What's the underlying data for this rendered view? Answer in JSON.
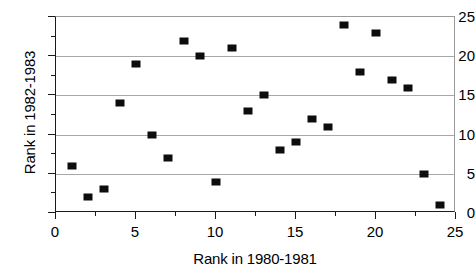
{
  "chart_data": {
    "type": "scatter",
    "title": "",
    "xlabel": "Rank in 1980-1981",
    "ylabel": "Rank in 1982-1983",
    "xlim": [
      0,
      25
    ],
    "ylim": [
      0,
      25
    ],
    "xticks": [
      0,
      5,
      10,
      15,
      20,
      25
    ],
    "xtick_labels": [
      "0",
      "5",
      "10",
      "15",
      "20",
      "25"
    ],
    "xminorticks": [
      2.5,
      7.5,
      12.5,
      17.5,
      22.5
    ],
    "yticks": [
      0,
      5,
      10,
      15,
      20,
      25
    ],
    "ytick_labels": [
      "0",
      "5",
      "10",
      "15",
      "20",
      "25"
    ],
    "yminorticks": [
      2.5,
      7.5,
      12.5,
      17.5,
      22.5
    ],
    "grid": "horizontal-major",
    "gridlines_y": [
      5,
      10,
      15,
      20
    ],
    "legend": "none",
    "marker": "filled-square",
    "marker_color": "#0d0d0d",
    "series": [
      {
        "name": "rank-pairs",
        "x": [
          1,
          2,
          3,
          4,
          5,
          6,
          7,
          8,
          9,
          10,
          11,
          12,
          13,
          14,
          15,
          16,
          17,
          18,
          19,
          20,
          21,
          22,
          23,
          24
        ],
        "y": [
          6,
          2,
          3,
          14,
          19,
          10,
          7,
          22,
          20,
          4,
          21,
          13,
          15,
          8,
          9,
          12,
          11,
          24,
          18,
          23,
          17,
          16,
          5,
          1
        ]
      }
    ],
    "points": [
      {
        "x": 1,
        "y": 6
      },
      {
        "x": 2,
        "y": 2
      },
      {
        "x": 3,
        "y": 3
      },
      {
        "x": 4,
        "y": 14
      },
      {
        "x": 5,
        "y": 19
      },
      {
        "x": 6,
        "y": 10
      },
      {
        "x": 7,
        "y": 7
      },
      {
        "x": 8,
        "y": 22
      },
      {
        "x": 9,
        "y": 20
      },
      {
        "x": 10,
        "y": 4
      },
      {
        "x": 11,
        "y": 21
      },
      {
        "x": 12,
        "y": 13
      },
      {
        "x": 13,
        "y": 15
      },
      {
        "x": 14,
        "y": 8
      },
      {
        "x": 15,
        "y": 9
      },
      {
        "x": 16,
        "y": 12
      },
      {
        "x": 17,
        "y": 11
      },
      {
        "x": 18,
        "y": 24
      },
      {
        "x": 19,
        "y": 18
      },
      {
        "x": 20,
        "y": 23
      },
      {
        "x": 21,
        "y": 17
      },
      {
        "x": 22,
        "y": 16
      },
      {
        "x": 23,
        "y": 5
      },
      {
        "x": 24,
        "y": 1
      }
    ]
  },
  "colors": {
    "marker": "#0d0d0d",
    "gridline": "#a8a8a8",
    "axis": "#1a1a1a",
    "frame_light": "#9a9a9a",
    "background": "#ffffff"
  }
}
